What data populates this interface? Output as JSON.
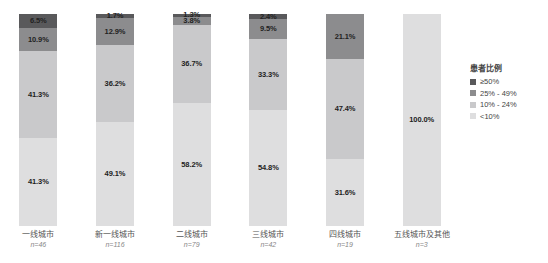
{
  "chart_data": {
    "type": "bar",
    "subtype": "stacked-100-percent",
    "title": "",
    "xlabel": "",
    "ylabel": "",
    "ylim": [
      0,
      100
    ],
    "grid": false,
    "legend_position": "right",
    "legend_title": "患者比例",
    "categories": [
      "一线城市",
      "新一线城市",
      "二线城市",
      "三线城市",
      "四线城市",
      "五线城市及其他"
    ],
    "category_counts": [
      "n=46",
      "n=116",
      "n=79",
      "n=42",
      "n=19",
      "n=3"
    ],
    "series": [
      {
        "name": "≥50%",
        "color": "#59595b",
        "values": [
          6.5,
          1.7,
          1.3,
          2.4,
          0.0,
          0.0
        ],
        "labels": [
          "6.5%",
          "1.7%",
          "1.3%",
          "2.4%",
          "",
          ""
        ]
      },
      {
        "name": "25% - 49%",
        "color": "#8c8c8e",
        "values": [
          10.9,
          12.9,
          3.8,
          9.5,
          21.1,
          0.0
        ],
        "labels": [
          "10.9%",
          "12.9%",
          "3.8%",
          "9.5%",
          "21.1%",
          ""
        ]
      },
      {
        "name": "10% - 24%",
        "color": "#c9c9cb",
        "values": [
          41.3,
          36.2,
          36.7,
          33.3,
          47.4,
          0.0
        ],
        "labels": [
          "41.3%",
          "36.2%",
          "36.7%",
          "33.3%",
          "47.4%",
          ""
        ]
      },
      {
        "name": "<10%",
        "color": "#dededf",
        "values": [
          41.3,
          49.1,
          58.2,
          54.8,
          31.6,
          100.0
        ],
        "labels": [
          "41.3%",
          "49.1%",
          "58.2%",
          "54.8%",
          "31.6%",
          "100.0%"
        ]
      }
    ]
  },
  "legend": {
    "title": "患者比例",
    "items": [
      {
        "label": "≥50%",
        "color": "#59595b"
      },
      {
        "label": "25% - 49%",
        "color": "#8c8c8e"
      },
      {
        "label": "10% - 24%",
        "color": "#c9c9cb"
      },
      {
        "label": "<10%",
        "color": "#dededf"
      }
    ]
  }
}
